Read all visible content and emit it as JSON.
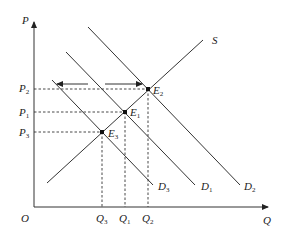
{
  "diagram": {
    "type": "supply-demand",
    "axes": {
      "y_label": "P",
      "x_label": "Q",
      "origin_label": "O"
    },
    "supply": {
      "label": "S"
    },
    "demand_curves": [
      {
        "label": "D",
        "sub": "3"
      },
      {
        "label": "D",
        "sub": "1"
      },
      {
        "label": "D",
        "sub": "2"
      }
    ],
    "equilibria": [
      {
        "label": "E",
        "sub": "2"
      },
      {
        "label": "E",
        "sub": "1"
      },
      {
        "label": "E",
        "sub": "3"
      }
    ],
    "price_levels": [
      {
        "label": "P",
        "sub": "2"
      },
      {
        "label": "P",
        "sub": "1"
      },
      {
        "label": "P",
        "sub": "3"
      }
    ],
    "quantity_levels": [
      {
        "label": "Q",
        "sub": "3"
      },
      {
        "label": "Q",
        "sub": "1"
      },
      {
        "label": "Q",
        "sub": "2"
      }
    ],
    "arrows": [
      {
        "direction": "left"
      },
      {
        "direction": "right"
      }
    ]
  }
}
